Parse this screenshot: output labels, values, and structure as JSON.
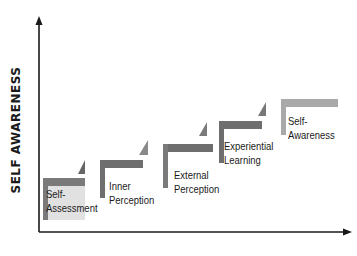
{
  "diagram": {
    "y_axis_label": "SELF AWARENESS",
    "x_axis_label": "",
    "colors": {
      "bar_dark": "#6e6e6e",
      "bar_light": "#a9a9a9",
      "axis": "#1a1a1a",
      "text": "#1a1a1a"
    },
    "steps": [
      {
        "line1": "Self-",
        "line2": "Assessment"
      },
      {
        "line1": "Inner",
        "line2": "Perception"
      },
      {
        "line1": "External",
        "line2": "Perception"
      },
      {
        "line1": "Experiential",
        "line2": "Learning"
      },
      {
        "line1": "Self-",
        "line2": "Awareness"
      }
    ]
  }
}
